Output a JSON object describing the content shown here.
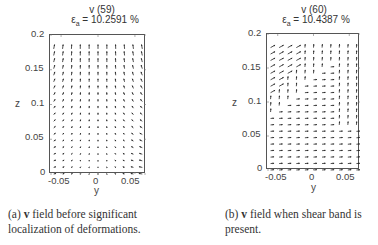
{
  "figure": {
    "panels": [
      {
        "id": "a",
        "title_line1": "v  (59)",
        "title_line2_prefix": "ε",
        "title_line2_sub": "a",
        "title_line2_value": " = 10.2591 %",
        "xlabel": "y",
        "ylabel": "z",
        "xticks": [
          "-0.05",
          "0",
          "0.05"
        ],
        "yticks": [
          "0",
          "0.05",
          "0.1",
          "0.15",
          "0.2"
        ],
        "caption_label": "(a)",
        "caption_bold": "v",
        "caption_text": " field before significant localization of deformations."
      },
      {
        "id": "b",
        "title_line1": "v  (60)",
        "title_line2_prefix": "ε",
        "title_line2_sub": "a",
        "title_line2_value": " = 10.4387 %",
        "xlabel": "y",
        "ylabel": "z",
        "xticks": [
          "-0.05",
          "0",
          "0.05"
        ],
        "yticks": [
          "0",
          "0.05",
          "0.1",
          "0.15",
          "0.2"
        ],
        "caption_label": "(b)",
        "caption_bold": "v",
        "caption_text": " field when shear band is present."
      }
    ]
  },
  "chart_data": [
    {
      "type": "quiver",
      "title": "v (59), ε_a = 10.2591 %",
      "xlabel": "y",
      "ylabel": "z",
      "xlim": [
        -0.065,
        0.065
      ],
      "ylim": [
        0,
        0.2
      ],
      "xticks": [
        -0.05,
        0,
        0.05
      ],
      "yticks": [
        0,
        0.05,
        0.1,
        0.15,
        0.2
      ],
      "grid": {
        "columns": 11,
        "rows": 20,
        "y_range": [
          -0.06,
          0.06
        ],
        "z_range": [
          0.0,
          0.18
        ]
      },
      "pattern": "near-vertical upward arrows at top; arrows tilt inward/horizontal toward bottom-right; diffuse deformation (no localization)"
    },
    {
      "type": "quiver",
      "title": "v (60), ε_a = 10.4387 %",
      "xlabel": "y",
      "ylabel": "z",
      "xlim": [
        -0.065,
        0.065
      ],
      "ylim": [
        0,
        0.2
      ],
      "xticks": [
        -0.05,
        0,
        0.05
      ],
      "yticks": [
        0,
        0.05,
        0.1,
        0.15,
        0.2
      ],
      "grid": {
        "columns": 11,
        "rows": 20,
        "y_range": [
          -0.06,
          0.06
        ],
        "z_range": [
          0.0,
          0.18
        ]
      },
      "pattern": "upper-right region vertical arrows; lower-left region horizontal arrows pointing +y; diagonal shear band separating regions; longer oblique arrows at top-left"
    }
  ]
}
